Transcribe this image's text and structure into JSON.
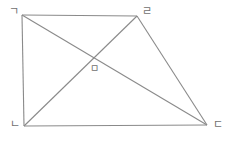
{
  "figure": {
    "background_color": "#ffffff",
    "stroke_color": "#8a8a8a",
    "label_color": "#6f6f6f",
    "vertices": [
      {
        "id": "top-left",
        "label": "ㄱ",
        "x": 22,
        "y": 15,
        "label_x": 9,
        "label_y": 6
      },
      {
        "id": "top-right",
        "label": "ㄹ",
        "x": 137,
        "y": 16,
        "label_x": 142,
        "label_y": 6
      },
      {
        "id": "bottom-right",
        "label": "ㄷ",
        "x": 207,
        "y": 125,
        "label_x": 213,
        "label_y": 119
      },
      {
        "id": "bottom-left",
        "label": "ㄴ",
        "x": 24,
        "y": 126,
        "label_x": 10,
        "label_y": 119
      }
    ],
    "intersection": {
      "id": "center",
      "label": "ㅁ",
      "x": 92,
      "y": 61,
      "label_x": 90,
      "label_y": 64
    },
    "edges": [
      {
        "id": "edge-top",
        "from": "top-left",
        "to": "top-right"
      },
      {
        "id": "edge-right",
        "from": "top-right",
        "to": "bottom-right"
      },
      {
        "id": "edge-bottom",
        "from": "bottom-right",
        "to": "bottom-left"
      },
      {
        "id": "edge-left",
        "from": "bottom-left",
        "to": "top-left"
      }
    ],
    "diagonals": [
      {
        "id": "diagonal-top-left-to-bottom-right",
        "from": "top-left",
        "to": "bottom-right"
      },
      {
        "id": "diagonal-bottom-left-to-top-right",
        "from": "bottom-left",
        "to": "top-right"
      }
    ]
  }
}
